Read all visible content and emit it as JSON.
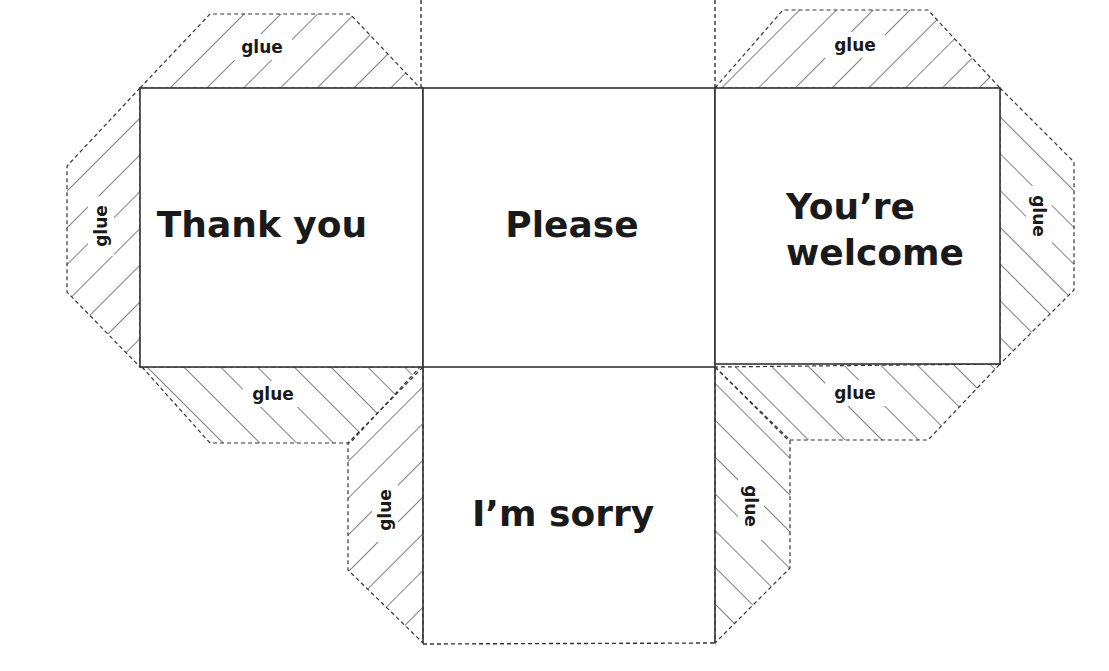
{
  "diagram": {
    "type": "cube-net",
    "faces": [
      {
        "id": "left",
        "lines": [
          "Thank you"
        ]
      },
      {
        "id": "center",
        "lines": [
          "Please"
        ]
      },
      {
        "id": "right",
        "lines": [
          "You’re",
          "welcome"
        ]
      },
      {
        "id": "bottom",
        "lines": [
          "I’m sorry"
        ]
      },
      {
        "id": "top",
        "lines": []
      }
    ],
    "glue_label": "glue",
    "glue_tabs": [
      "left-face-top",
      "left-face-left",
      "left-face-bottom",
      "right-face-top",
      "right-face-right",
      "right-face-bottom",
      "bottom-face-left",
      "bottom-face-right"
    ],
    "colors": {
      "line": "#333333",
      "text": "#1a1a1a",
      "background": "#ffffff"
    }
  }
}
